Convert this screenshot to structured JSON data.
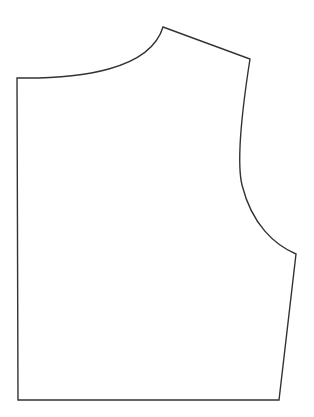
{
  "diagram": {
    "type": "sewing-pattern-piece",
    "piece": "bodice",
    "stroke_color": "#333333",
    "background_color": "#ffffff",
    "points": {
      "center_top": [
        17,
        78
      ],
      "neck_shoulder": [
        163,
        27
      ],
      "shoulder_tip": [
        250,
        59
      ],
      "armhole_bottom": [
        296,
        254
      ],
      "hem_side": [
        279,
        400
      ],
      "hem_center": [
        18,
        400
      ]
    },
    "outline_path": "M17,78 C80,79 150,70 163,27 L250,59 C242,110 236,160 242,185 C252,225 275,245 296,254 L279,400 L18,400 Z"
  }
}
